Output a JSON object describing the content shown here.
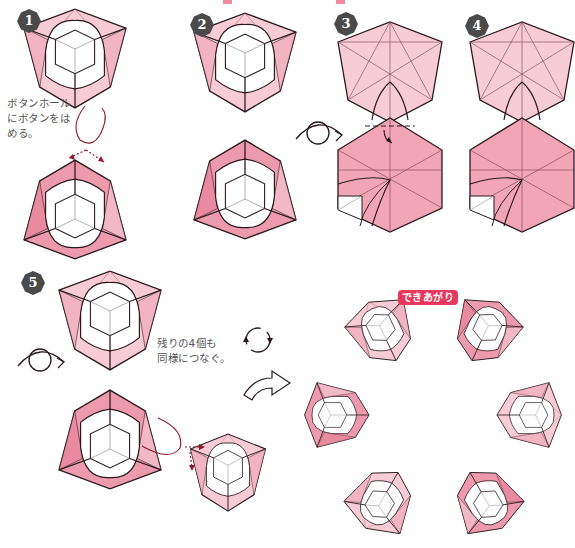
{
  "steps": [
    {
      "number": "1",
      "note": "ボタンホール\nにボタンをは\nめる。"
    },
    {
      "number": "2"
    },
    {
      "number": "3"
    },
    {
      "number": "4"
    },
    {
      "number": "5",
      "note": "残りの4個も\n同様につなぐ。"
    }
  ],
  "result": {
    "label": "できあがり"
  },
  "colors": {
    "light_pink": "#f7ccd6",
    "mid_pink": "#ee9aae",
    "dark_pink": "#e8385e",
    "badge": "#4a4a4a",
    "line": "#2a1a1e",
    "arrow_dot": "#8a1a2e"
  },
  "symbols": [
    "turn-over-icon",
    "rotate-icon",
    "next-arrow-icon",
    "insert-arrow-icon"
  ]
}
